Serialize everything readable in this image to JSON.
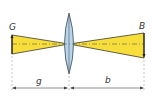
{
  "diagram": {
    "labels": {
      "object": "G",
      "image": "B",
      "object_distance": "g",
      "image_distance": "b"
    },
    "colors": {
      "ray_fill": "#f7de3a",
      "ray_stroke": "#3a3a3a",
      "lens_fill": "#b9d3e8",
      "lens_stroke": "#4a5a6a",
      "axis": "#555555",
      "dim_line": "#444444"
    },
    "geometry": {
      "axis_y": 44,
      "lens_x": 69,
      "object": {
        "x": 12,
        "top": 35,
        "bottom": 54
      },
      "image": {
        "x": 144,
        "top": 33,
        "bottom": 58
      },
      "dimension_y": 88
    }
  }
}
